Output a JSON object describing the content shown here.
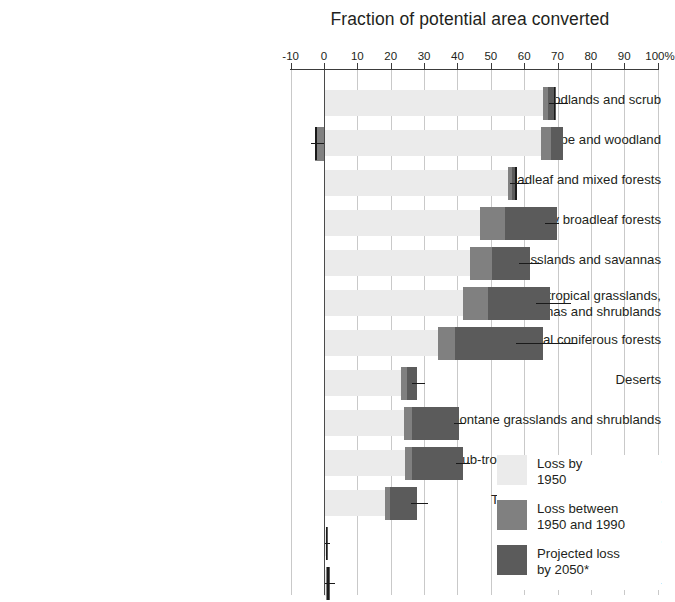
{
  "chart_data": {
    "type": "bar",
    "orientation": "horizontal",
    "title": "Fraction of potential area converted",
    "xlabel": "",
    "ylabel": "",
    "xlim": [
      -10,
      100
    ],
    "xticks": [
      -10,
      0,
      10,
      20,
      30,
      40,
      50,
      60,
      70,
      80,
      90,
      100
    ],
    "xticklabels": [
      "-10",
      "0",
      "10",
      "20",
      "30",
      "40",
      "50",
      "60",
      "70",
      "80",
      "90",
      "100%"
    ],
    "grid": true,
    "legend_position": "bottom-right",
    "stacked": true,
    "colors": {
      "loss_by_1950": "#ebebeb",
      "loss_1950_1990": "#808080",
      "projected_2050": "#5b5b5b",
      "error_bar": "#1a1a1a",
      "gridline": "#c9c9c9",
      "axis": "#3b3b3b",
      "text": "#231f20"
    },
    "series": [
      {
        "name": "Loss by 1950",
        "key": "loss_by_1950"
      },
      {
        "name": "Loss between 1950 and 1990",
        "key": "loss_1950_1990"
      },
      {
        "name": "Projected loss by 2050*",
        "key": "projected_2050"
      }
    ],
    "categories": [
      "Mediterranean forests, woodlands and scrub",
      "Temperate forest steppe and woodland",
      "Temperate broadleaf and mixed forests",
      "Tropical and sub-tropical dry broadleaf forests",
      "Flooded grasslands and savannas",
      "Tropical and sub-tropical grasslands,\nsavannas and shrublands",
      "Tropical and sub-tropical coniferous forests",
      "Deserts",
      "Montane grasslands and shrublands",
      "Tropical and sub-tropical moist broadleaf forests",
      "Temperate coniferous forests",
      "Boreal forests",
      "Tundra"
    ],
    "rows": [
      {
        "label": "Mediterranean forests, woodlands and scrub",
        "loss_by_1950": 65.7,
        "loss_1950_1990": 1.5,
        "projected_2050": 2.2,
        "total": 69.4,
        "error_low": 67.5,
        "error_high": 73.2,
        "negative_segment": 0
      },
      {
        "label": "Temperate forest steppe and woodland",
        "loss_by_1950": 65.1,
        "loss_1950_1990": 3.0,
        "projected_2050": 3.4,
        "total": 71.5,
        "error_low": -4.0,
        "error_high": 0,
        "negative_segment": -2.7
      },
      {
        "label": "Temperate broadleaf and mixed forests",
        "loss_by_1950": 55.2,
        "loss_1950_1990": 1.2,
        "projected_2050": 1.2,
        "total": 57.6,
        "error_low": 55.8,
        "error_high": 61.0,
        "negative_segment": 0
      },
      {
        "label": "Tropical and sub-tropical dry broadleaf forests",
        "loss_by_1950": 46.8,
        "loss_1950_1990": 7.5,
        "projected_2050": 15.6,
        "total": 69.9,
        "error_low": 66.2,
        "error_high": 70.3,
        "negative_segment": 0
      },
      {
        "label": "Flooded grasslands and savannas",
        "loss_by_1950": 43.8,
        "loss_1950_1990": 6.6,
        "projected_2050": 11.4,
        "total": 61.8,
        "error_low": 58.6,
        "error_high": 64.9,
        "negative_segment": 0
      },
      {
        "label": "Tropical and sub-tropical grasslands, savannas and shrublands",
        "loss_by_1950": 41.7,
        "loss_1950_1990": 7.5,
        "projected_2050": 18.6,
        "total": 67.8,
        "error_low": 63.5,
        "error_high": 73.9,
        "negative_segment": 0
      },
      {
        "label": "Tropical and sub-tropical coniferous forests",
        "loss_by_1950": 34.2,
        "loss_1950_1990": 5.1,
        "projected_2050": 26.4,
        "total": 65.7,
        "error_low": 57.7,
        "error_high": 75.9,
        "negative_segment": 0
      },
      {
        "label": "Deserts",
        "loss_by_1950": 23.1,
        "loss_1950_1990": 1.8,
        "projected_2050": 3.0,
        "total": 27.9,
        "error_low": 26.4,
        "error_high": 30.3,
        "negative_segment": 0
      },
      {
        "label": "Montane grasslands and shrublands",
        "loss_by_1950": 24.0,
        "loss_1950_1990": 2.4,
        "projected_2050": 14.1,
        "total": 40.5,
        "error_low": 38.9,
        "error_high": 42.3,
        "negative_segment": 0
      },
      {
        "label": "Tropical and sub-tropical moist broadleaf forests",
        "loss_by_1950": 24.3,
        "loss_1950_1990": 2.1,
        "projected_2050": 15.3,
        "total": 41.7,
        "error_low": 39.6,
        "error_high": 43.8,
        "negative_segment": 0
      },
      {
        "label": "Temperate coniferous forests",
        "loss_by_1950": 18.3,
        "loss_1950_1990": 1.5,
        "projected_2050": 8.1,
        "total": 27.9,
        "error_low": 26.1,
        "error_high": 31.2,
        "negative_segment": 0
      },
      {
        "label": "Boreal forests",
        "loss_by_1950": 0.6,
        "loss_1950_1990": 0.2,
        "projected_2050": 0.2,
        "total": 1.0,
        "error_low": 0.3,
        "error_high": 1.8,
        "negative_segment": 0
      },
      {
        "label": "Tundra",
        "loss_by_1950": 0.5,
        "loss_1950_1990": 0.6,
        "projected_2050": 0.7,
        "total": 1.8,
        "error_low": 0.2,
        "error_high": 3.3,
        "negative_segment": 0
      }
    ]
  },
  "legend": {
    "items": [
      {
        "label": "Loss by\n1950",
        "color": "#ebebeb"
      },
      {
        "label": "Loss between\n1950 and 1990",
        "color": "#808080"
      },
      {
        "label": "Projected loss\nby 2050*",
        "color": "#5b5b5b"
      }
    ]
  }
}
